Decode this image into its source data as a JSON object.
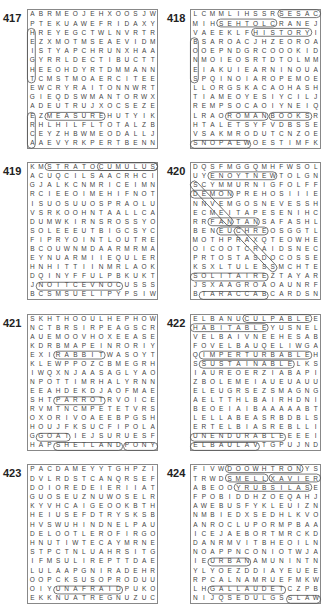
{
  "page": {
    "puzzles": [
      {
        "number": "417",
        "rows": [
          "ABRMEOJEHXOOSJW",
          "PTEKUAWEFRIDAXY",
          "HREYEGCTWLNVRTR",
          "EZXMOTMSEAEVIDM",
          "ISTYAPCHRUNXHAA",
          "GYRRLDECTIBUCTT",
          "HEEOHDYRTDMMANN",
          "TCMSTMOAERCITEE",
          "EWCRYRAITONNWRT",
          "GIEQDSWMANTORWX",
          "ADEUTRUJXOCSEZE",
          "EZMEASUREHUTYIK",
          "RHLHILFLTOTALZB",
          "CEYZHBWMEODALLJ",
          "AAEVYRKPERTBENN"
        ],
        "highlighted_words": [
          "MEASURE",
          "HEIGHT",
          "ACRE",
          "INTERNET",
          "TABLE"
        ]
      },
      {
        "number": "418",
        "rows": [
          "LCMMLIHSSRSESAC",
          "MIHSEHTOLCRANEJ",
          "VAEEKLFHISTORYI",
          "BSAROACJHZEOROA",
          "OOEPNDGRCOOOKID",
          "NMOIEOSRTDTOLMM",
          "EIAKUIEARNINOUA",
          "SPQINOIAROPEMOE",
          "LLORGSKACAOHASH",
          "TIAMEOYESIYCILJ",
          "REMPSOCAOIYNEIQ",
          "LRAOROMANBOOKSR",
          "HTALETSYFVDBSSE",
          "VSAKMRODUTCNZOE",
          "SNOPAEWOESTIMFK"
        ],
        "highlighted_words": [
          "SESAC",
          "CLOTHES",
          "HISTORY",
          "BONES",
          "ROMAN",
          "BOOKS",
          "TABLETS",
          "PRODUCT",
          "SNOPAEW",
          "GREEK"
        ]
      },
      {
        "number": "419",
        "rows": [
          "KMSTRATOCUMULUS",
          "ACUQCILSAACRHCI",
          "GJALKCNMRICEIMN",
          "RCIEEOIMEHIFNOT",
          "ISUOSUUOSPRAOLU",
          "VSRKOOHNTAALLCA",
          "DUMWKIRNSROSSYO",
          "SOLEEEUTBIGCSYC",
          "FIPRYOINTLOUTRE",
          "BCOUWNMDAARMRMA",
          "EYNUARMIIEQULER",
          "HNHITTIINMRLAOK",
          "DQINYFFULPBKUKT",
          "JNOITCEVNOCUSSS",
          "BCSMSUELIPYPSIW"
        ],
        "highlighted_words": [
          "STRATOCUMULUS",
          "CIRRUS",
          "CONVECTION",
          "CUMULUS",
          "NIMBUS",
          "CIRROCUMULUS",
          "FLUFFY",
          "STORMS",
          "WHITE"
        ]
      },
      {
        "number": "420",
        "rows": [
          "DQSFMGGQMHFWSOL",
          "UYENOYTNEWTOLGN",
          "SCYMMURNIGFOLFF",
          "DEMONPREHOSIIIE",
          "NNVEMGOSNEVESSH",
          "ECMEITAPESENIHC",
          "RRFANTANSAFASHL",
          "BENEUCHREOSGGTL",
          "MOTHPRAXQTEOWHE",
          "OICOOTCRAIDSNEC",
          "PRTOSTASDOCOSSE",
          "KSXLTULESSMCHTE",
          "SOLITAIREZTAYAR",
          "JSXAAGROAOAUNRF",
          "BTARACCABCARDSN"
        ],
        "highlighted_words": [
          "ENOYTNEW",
          "SEVEN",
          "DEMON",
          "FANTAN",
          "EUCHRE",
          "SOLITAIRE",
          "TARACCAB",
          "CARDS",
          "PATIENCE",
          "CRAPS"
        ]
      },
      {
        "number": "421",
        "rows": [
          "SKHTHOOULHEPHOW",
          "NCTBRSIRPEAGSCR",
          "AUEMOOVHOXEEASE",
          "KDRBMAPEINRORIY",
          "EXIRABBITWASOYT",
          "KLEWPPOZCBMEGRH",
          "IWQXNJAASAGLYAO",
          "NPOTTIMRHALYRNN",
          "EEAHDEKDJAOFMAE",
          "SHTPARROTRVOICE",
          "RVMTNCMPETETVRS",
          "OXORIVOAEEBPGSH",
          "HOUJFKSUCFIPOLA",
          "GGOATIEJSURUESF",
          "HAPSHETLANDPONY"
        ],
        "highlighted_words": [
          "SHETLAND",
          "PONY",
          "PARROT",
          "GOAT",
          "RABBIT"
        ]
      },
      {
        "number": "422",
        "rows": [
          "ELBANUCULPABLEE",
          "HABITABLEYUSNEL",
          "VELBAIVNEEHESAB",
          "FOVELBAUQELIWGA",
          "QIMPERTURBABLEH",
          "SSUSTAINABLELKS",
          "IAUREOERZIABAPI",
          "ZBOLEMEIAUEUAUU",
          "ELEUGRSEZSMAGNG",
          "AELTTHLBAIRHDNI",
          "BEOEIAIBAAAAABT",
          "LELLABEASRBDBLS",
          "ERTELBIASREBLLI",
          "UNENDURABLEEEEI",
          "ELBAULAVTGPUJND"
        ],
        "highlighted_words": [
          "CULPABLE",
          "HABITABLE",
          "IMPERTURBABLE",
          "SUSTAINABLE",
          "UNENDURABLE",
          "ELBAULAV"
        ]
      },
      {
        "number": "423",
        "rows": [
          "PACDAMEYYTGHPZI",
          "DVLRDSTCANQRSEF",
          "DOIOREDEIERIIAT",
          "GUOSEUZNUWOSELR",
          "KYVHCAIGEOOKBTH",
          "HEIUSEFDTRYSKSB",
          "HVSWUHINDNELPAU",
          "DELOOTLEROFIRGO",
          "HNUTIWTECAYMRNE",
          "STPCTNLUAHRSITG",
          "IFMSULIREPTTDAE",
          "LULAAPGNIRADEHR",
          "OOPCKSUSOPRODUU",
          "OIYUNAFRAIDPUKO",
          "EKKNUATREGNUZUC"
        ],
        "highlighted_words": [
          "UNAFRAID",
          "UNSURE",
          "ISOLATE",
          "SILLENCE"
        ]
      },
      {
        "number": "424",
        "rows": [
          "FIVWDOOWHTRONYS",
          "TRWDSMELLXAVIER",
          "ABEOOYRUBSILASE",
          "FPOBIDDHZOEQAHJ",
          "AWEBUSFYKLEUIZN",
          "NMBIEDXSEDHLKVO",
          "ANROCLUPORMPBAA",
          "ICEJAEBORTMRCKD",
          "DANRMVITBHEOILN",
          "NOAPPNCONIOTWJA",
          "IEURBANAMUNINTN",
          "YLYOEZDDIAYEUEE",
          "RPCALNAMRUEFMKW",
          "LHGALLAUDETCZPB",
          "NIJQSEDULGSSLAW"
        ],
        "highlighted_words": [
          "DOOWHTRON",
          "SMELL",
          "XAVIER",
          "YRUBSILAS",
          "NAMRUF",
          "GALLAUDET",
          "SLAW",
          "URBAN"
        ]
      }
    ]
  }
}
